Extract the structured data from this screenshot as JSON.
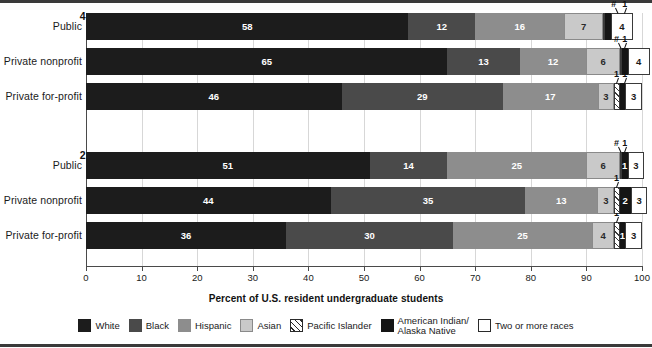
{
  "axis": {
    "title": "Percent of U.S. resident undergraduate students",
    "ticks": [
      "0",
      "10",
      "20",
      "30",
      "40",
      "50",
      "60",
      "70",
      "80",
      "90",
      "100"
    ],
    "min": 0,
    "max": 100
  },
  "groups": [
    {
      "title": "4-year",
      "rows": [
        "Public",
        "Private nonprofit",
        "Private for-profit"
      ]
    },
    {
      "title": "2-year",
      "rows": [
        "Public",
        "Private nonprofit",
        "Private for-profit"
      ]
    }
  ],
  "legend": {
    "items": [
      {
        "key": "white",
        "label": "White",
        "icon": "legend-swatch-white",
        "color": "#1c1c1c"
      },
      {
        "key": "black",
        "label": "Black",
        "icon": "legend-swatch-black",
        "color": "#4a4a4a"
      },
      {
        "key": "hispanic",
        "label": "Hispanic",
        "icon": "legend-swatch-hispanic",
        "color": "#8d8d8d"
      },
      {
        "key": "asian",
        "label": "Asian",
        "icon": "legend-swatch-asian",
        "color": "#c9c9c9"
      },
      {
        "key": "pacific",
        "label": "Pacific Islander",
        "icon": "legend-swatch-pacific",
        "color": "#ffffff"
      },
      {
        "key": "amind",
        "label": "American Indian/\nAlaska Native",
        "icon": "legend-swatch-amind",
        "color": "#151515"
      },
      {
        "key": "two",
        "label": "Two or more races",
        "icon": "legend-swatch-two",
        "color": "#ffffff"
      }
    ]
  },
  "chart_data": {
    "type": "bar",
    "orientation": "horizontal",
    "stacked": true,
    "title": "",
    "xlabel": "Percent of U.S. resident undergraduate students",
    "ylabel": "",
    "xlim": [
      0,
      100
    ],
    "grid": true,
    "legend_position": "bottom",
    "categories": [
      "4-year Public",
      "4-year Private nonprofit",
      "4-year Private for-profit",
      "2-year Public",
      "2-year Private nonprofit",
      "2-year Private for-profit"
    ],
    "series": [
      {
        "name": "White",
        "values": [
          58,
          65,
          46,
          51,
          44,
          36
        ]
      },
      {
        "name": "Black",
        "values": [
          12,
          13,
          29,
          14,
          35,
          30
        ]
      },
      {
        "name": "Hispanic",
        "values": [
          16,
          12,
          17,
          25,
          13,
          25
        ]
      },
      {
        "name": "Asian",
        "values": [
          7,
          6,
          3,
          6,
          3,
          4
        ]
      },
      {
        "name": "Pacific Islander",
        "values": [
          "#",
          "#",
          1,
          "#",
          1,
          1
        ]
      },
      {
        "name": "American Indian/Alaska Native",
        "values": [
          1,
          1,
          1,
          1,
          2,
          1
        ]
      },
      {
        "name": "Two or more races",
        "values": [
          4,
          4,
          3,
          3,
          3,
          3
        ]
      }
    ],
    "bars": [
      {
        "group": "4-year",
        "row": "Public",
        "segments": [
          {
            "key": "white",
            "value": 58,
            "label": "58",
            "inline": true
          },
          {
            "key": "black",
            "value": 12,
            "label": "12",
            "inline": true
          },
          {
            "key": "hispanic",
            "value": 16,
            "label": "16",
            "inline": true
          },
          {
            "key": "asian",
            "value": 7,
            "label": "7",
            "inline": true
          },
          {
            "key": "pacific",
            "value": 0.4,
            "label": "#",
            "inline": false
          },
          {
            "key": "amind",
            "value": 1,
            "label": "1",
            "inline": false
          },
          {
            "key": "two",
            "value": 4,
            "label": "4",
            "inline": true
          }
        ]
      },
      {
        "group": "4-year",
        "row": "Private nonprofit",
        "segments": [
          {
            "key": "white",
            "value": 65,
            "label": "65",
            "inline": true
          },
          {
            "key": "black",
            "value": 13,
            "label": "13",
            "inline": true
          },
          {
            "key": "hispanic",
            "value": 12,
            "label": "12",
            "inline": true
          },
          {
            "key": "asian",
            "value": 6,
            "label": "6",
            "inline": true
          },
          {
            "key": "pacific",
            "value": 0.4,
            "label": "#",
            "inline": false
          },
          {
            "key": "amind",
            "value": 1,
            "label": "1",
            "inline": false
          },
          {
            "key": "two",
            "value": 4,
            "label": "4",
            "inline": true
          }
        ]
      },
      {
        "group": "4-year",
        "row": "Private for-profit",
        "segments": [
          {
            "key": "white",
            "value": 46,
            "label": "46",
            "inline": true
          },
          {
            "key": "black",
            "value": 29,
            "label": "29",
            "inline": true
          },
          {
            "key": "hispanic",
            "value": 17,
            "label": "17",
            "inline": true
          },
          {
            "key": "asian",
            "value": 3,
            "label": "3",
            "inline": true
          },
          {
            "key": "pacific",
            "value": 1,
            "label": "1",
            "inline": false
          },
          {
            "key": "amind",
            "value": 1,
            "label": "1",
            "inline": false
          },
          {
            "key": "two",
            "value": 3,
            "label": "3",
            "inline": true
          }
        ]
      },
      {
        "group": "2-year",
        "row": "Public",
        "segments": [
          {
            "key": "white",
            "value": 51,
            "label": "51",
            "inline": true
          },
          {
            "key": "black",
            "value": 14,
            "label": "14",
            "inline": true
          },
          {
            "key": "hispanic",
            "value": 25,
            "label": "25",
            "inline": true
          },
          {
            "key": "asian",
            "value": 6,
            "label": "6",
            "inline": true
          },
          {
            "key": "pacific",
            "value": 0.4,
            "label": "#",
            "inline": false
          },
          {
            "key": "amind",
            "value": 1,
            "label": "1",
            "inline": true
          },
          {
            "key": "two",
            "value": 3,
            "label": "3",
            "inline": true
          }
        ]
      },
      {
        "group": "2-year",
        "row": "Private nonprofit",
        "segments": [
          {
            "key": "white",
            "value": 44,
            "label": "44",
            "inline": true
          },
          {
            "key": "black",
            "value": 35,
            "label": "35",
            "inline": true
          },
          {
            "key": "hispanic",
            "value": 13,
            "label": "13",
            "inline": true
          },
          {
            "key": "asian",
            "value": 3,
            "label": "3",
            "inline": true
          },
          {
            "key": "pacific",
            "value": 1,
            "label": "1",
            "inline": false
          },
          {
            "key": "amind",
            "value": 2,
            "label": "2",
            "inline": true
          },
          {
            "key": "two",
            "value": 3,
            "label": "3",
            "inline": true
          }
        ]
      },
      {
        "group": "2-year",
        "row": "Private for-profit",
        "segments": [
          {
            "key": "white",
            "value": 36,
            "label": "36",
            "inline": true
          },
          {
            "key": "black",
            "value": 30,
            "label": "30",
            "inline": true
          },
          {
            "key": "hispanic",
            "value": 25,
            "label": "25",
            "inline": true
          },
          {
            "key": "asian",
            "value": 4,
            "label": "4",
            "inline": true
          },
          {
            "key": "pacific",
            "value": 1,
            "label": "1",
            "inline": false
          },
          {
            "key": "amind",
            "value": 1,
            "label": "1",
            "inline": true
          },
          {
            "key": "two",
            "value": 3,
            "label": "3",
            "inline": true
          }
        ]
      }
    ],
    "callouts": [
      {
        "bar": 0,
        "label": "#",
        "x": 95.0
      },
      {
        "bar": 0,
        "label": "1",
        "x": 97.0
      },
      {
        "bar": 1,
        "label": "#",
        "x": 95.5
      },
      {
        "bar": 1,
        "label": "1",
        "x": 97.0
      },
      {
        "bar": 2,
        "label": "1",
        "x": 95.5
      },
      {
        "bar": 2,
        "label": "1",
        "x": 97.0
      },
      {
        "bar": 3,
        "label": "#",
        "x": 95.5
      },
      {
        "bar": 3,
        "label": "1",
        "x": 97.0
      },
      {
        "bar": 4,
        "label": "1",
        "x": 95.5
      },
      {
        "bar": 5,
        "label": "1",
        "x": 95.5
      }
    ]
  }
}
